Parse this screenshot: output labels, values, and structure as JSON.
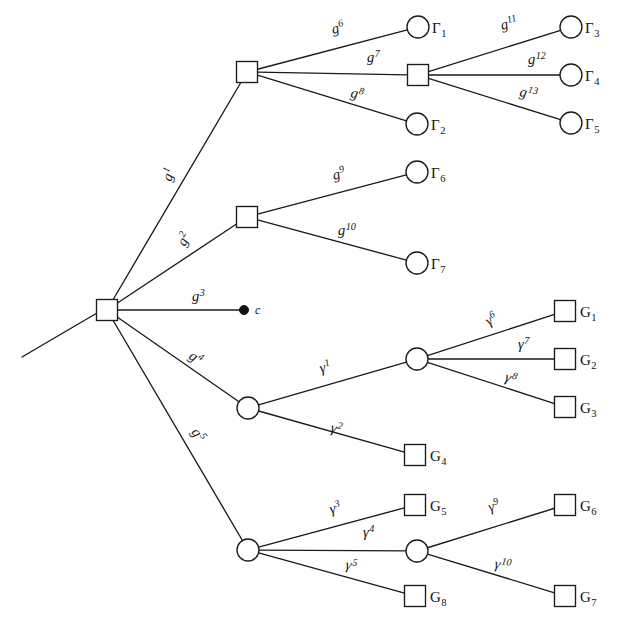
{
  "figure": {
    "type": "tree-diagram",
    "width": 628,
    "height": 628,
    "background": "#ffffff",
    "stroke_color": "#1a1a1a",
    "node_fill": "#ffffff"
  },
  "nodes": [
    {
      "id": "root",
      "shape": "square",
      "x": 107,
      "y": 310,
      "label": ""
    },
    {
      "id": "s1",
      "shape": "square",
      "x": 247,
      "y": 72,
      "label": ""
    },
    {
      "id": "s2",
      "shape": "square",
      "x": 418,
      "y": 75,
      "label": ""
    },
    {
      "id": "s3",
      "shape": "square",
      "x": 247,
      "y": 217,
      "label": ""
    },
    {
      "id": "c",
      "shape": "dot",
      "x": 244,
      "y": 310,
      "label": "c"
    },
    {
      "id": "o1",
      "shape": "circle",
      "x": 248,
      "y": 408,
      "label": ""
    },
    {
      "id": "o2",
      "shape": "circle",
      "x": 417,
      "y": 359,
      "label": ""
    },
    {
      "id": "o3",
      "shape": "circle",
      "x": 248,
      "y": 550,
      "label": ""
    },
    {
      "id": "o4",
      "shape": "circle",
      "x": 417,
      "y": 551,
      "label": ""
    },
    {
      "id": "Gam1",
      "shape": "circle",
      "x": 418,
      "y": 27,
      "label": "Γ",
      "sub": "1"
    },
    {
      "id": "Gam2",
      "shape": "circle",
      "x": 417,
      "y": 124,
      "label": "Γ",
      "sub": "2"
    },
    {
      "id": "Gam3",
      "shape": "circle",
      "x": 571,
      "y": 27,
      "label": "Γ",
      "sub": "3"
    },
    {
      "id": "Gam4",
      "shape": "circle",
      "x": 571,
      "y": 75,
      "label": "Γ",
      "sub": "4"
    },
    {
      "id": "Gam5",
      "shape": "circle",
      "x": 571,
      "y": 123,
      "label": "Γ",
      "sub": "5"
    },
    {
      "id": "Gam6",
      "shape": "circle",
      "x": 417,
      "y": 172,
      "label": "Γ",
      "sub": "6"
    },
    {
      "id": "Gam7",
      "shape": "circle",
      "x": 417,
      "y": 263,
      "label": "Γ",
      "sub": "7"
    },
    {
      "id": "G1",
      "shape": "square",
      "x": 565,
      "y": 311,
      "label": "G",
      "sub": "1"
    },
    {
      "id": "G2",
      "shape": "square",
      "x": 565,
      "y": 359,
      "label": "G",
      "sub": "2"
    },
    {
      "id": "G3",
      "shape": "square",
      "x": 565,
      "y": 407,
      "label": "G",
      "sub": "3"
    },
    {
      "id": "G4",
      "shape": "square",
      "x": 415,
      "y": 455,
      "label": "G",
      "sub": "4"
    },
    {
      "id": "G5",
      "shape": "square",
      "x": 415,
      "y": 505,
      "label": "G",
      "sub": "5"
    },
    {
      "id": "G6",
      "shape": "square",
      "x": 565,
      "y": 505,
      "label": "G",
      "sub": "6"
    },
    {
      "id": "G7",
      "shape": "square",
      "x": 565,
      "y": 596,
      "label": "G",
      "sub": "7"
    },
    {
      "id": "G8",
      "shape": "square",
      "x": 415,
      "y": 596,
      "label": "G",
      "sub": "8"
    }
  ],
  "incoming_stub": {
    "x1": 22,
    "y1": 357,
    "x2": 97,
    "y2": 313
  },
  "edges": [
    {
      "id": "e-g1",
      "from": "root",
      "to": "s1",
      "label": "g",
      "sup": "1",
      "lx": 171,
      "ly": 182,
      "rot": -72
    },
    {
      "id": "e-g2",
      "from": "root",
      "to": "s3",
      "label": "g",
      "sup": "2",
      "lx": 185,
      "ly": 247,
      "rot": -63
    },
    {
      "id": "e-g3",
      "from": "root",
      "to": "c",
      "label": "g",
      "sup": "3",
      "lx": 192,
      "ly": 301,
      "rot": 0
    },
    {
      "id": "e-g4",
      "from": "root",
      "to": "o1",
      "label": "g",
      "sup": "4",
      "lx": 188,
      "ly": 358,
      "rot": 34
    },
    {
      "id": "e-g5",
      "from": "root",
      "to": "o3",
      "label": "g",
      "sup": "5",
      "lx": 191,
      "ly": 432,
      "rot": 56
    },
    {
      "id": "e-g6",
      "from": "s1",
      "to": "Gam1",
      "label": "g",
      "sup": "6",
      "lx": 333,
      "ly": 34,
      "rot": -16
    },
    {
      "id": "e-g7",
      "from": "s1",
      "to": "s2",
      "label": "g",
      "sup": "7",
      "lx": 367,
      "ly": 62,
      "rot": 0
    },
    {
      "id": "e-g8",
      "from": "s1",
      "to": "Gam2",
      "label": "g",
      "sup": "8",
      "lx": 350,
      "ly": 97,
      "rot": 12
    },
    {
      "id": "e-g9",
      "from": "s3",
      "to": "Gam6",
      "label": "g",
      "sup": "9",
      "lx": 334,
      "ly": 180,
      "rot": -16
    },
    {
      "id": "e-g10",
      "from": "s3",
      "to": "Gam7",
      "label": "g",
      "sup": "10",
      "lx": 338,
      "ly": 235,
      "rot": 0
    },
    {
      "id": "e-g11",
      "from": "s2",
      "to": "Gam3",
      "label": "g",
      "sup": "11",
      "lx": 502,
      "ly": 30,
      "rot": -16
    },
    {
      "id": "e-g12",
      "from": "s2",
      "to": "Gam4",
      "label": "g",
      "sup": "12",
      "lx": 528,
      "ly": 64,
      "rot": 0
    },
    {
      "id": "e-g13",
      "from": "s2",
      "to": "Gam5",
      "label": "g",
      "sup": "13",
      "lx": 519,
      "ly": 96,
      "rot": 11
    },
    {
      "id": "e-y1",
      "from": "o1",
      "to": "o2",
      "label": "γ",
      "sup": "1",
      "lx": 321,
      "ly": 373,
      "rot": -16
    },
    {
      "id": "e-y2",
      "from": "o1",
      "to": "G4",
      "label": "γ",
      "sup": "2",
      "lx": 330,
      "ly": 432,
      "rot": 12
    },
    {
      "id": "e-y6",
      "from": "o2",
      "to": "G1",
      "label": "γ",
      "sup": "6",
      "lx": 489,
      "ly": 326,
      "rot": -33
    },
    {
      "id": "e-y7",
      "from": "o2",
      "to": "G2",
      "label": "γ",
      "sup": "7",
      "lx": 518,
      "ly": 349,
      "rot": 0
    },
    {
      "id": "e-y8",
      "from": "o2",
      "to": "G3",
      "label": "γ",
      "sup": "8",
      "lx": 504,
      "ly": 381,
      "rot": 18
    },
    {
      "id": "e-y3",
      "from": "o3",
      "to": "G5",
      "label": "γ",
      "sup": "3",
      "lx": 331,
      "ly": 514,
      "rot": -16
    },
    {
      "id": "e-y4",
      "from": "o3",
      "to": "o4",
      "label": "γ",
      "sup": "4",
      "lx": 363,
      "ly": 537,
      "rot": 0
    },
    {
      "id": "e-y5",
      "from": "o3",
      "to": "G8",
      "label": "γ",
      "sup": "5",
      "lx": 345,
      "ly": 569,
      "rot": 10
    },
    {
      "id": "e-y9",
      "from": "o4",
      "to": "G6",
      "label": "γ",
      "sup": "9",
      "lx": 490,
      "ly": 512,
      "rot": -19
    },
    {
      "id": "e-y10",
      "from": "o4",
      "to": "G7",
      "label": "γ",
      "sup": "10",
      "lx": 494,
      "ly": 568,
      "rot": 10
    }
  ]
}
